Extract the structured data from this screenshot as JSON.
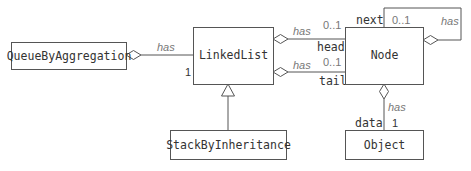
{
  "diagram": {
    "type": "UML class diagram",
    "classes": {
      "queue": "QueueByAggregation",
      "linkedlist": "LinkedList",
      "stack": "StackByInheritance",
      "node": "Node",
      "object": "Object"
    },
    "relationships": {
      "queue_linkedlist": {
        "label": "has",
        "multiplicity": "1",
        "kind": "aggregation"
      },
      "linkedlist_node_head": {
        "label": "has",
        "multiplicity": "0..1",
        "role": "head",
        "kind": "aggregation"
      },
      "linkedlist_node_tail": {
        "label": "has",
        "multiplicity": "0..1",
        "role": "tail",
        "kind": "aggregation"
      },
      "node_node_next": {
        "label": "has",
        "multiplicity": "0..1",
        "role": "next",
        "kind": "aggregation"
      },
      "node_object_data": {
        "label": "has",
        "multiplicity": "1",
        "role": "data",
        "kind": "aggregation"
      },
      "stack_linkedlist": {
        "kind": "generalization"
      }
    }
  }
}
